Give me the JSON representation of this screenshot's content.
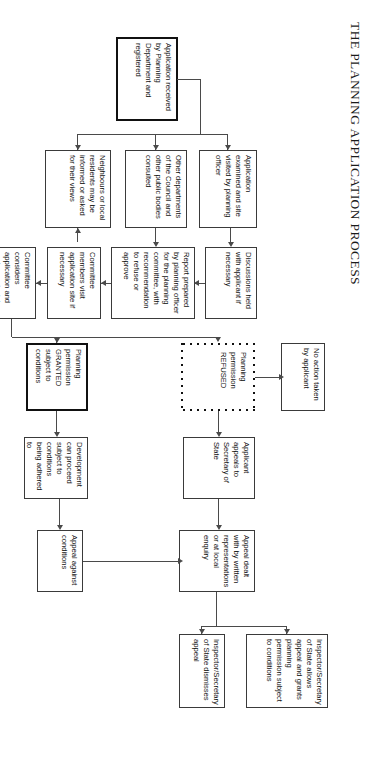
{
  "document": {
    "title": "THE PLANNING APPLICATION PROCESS",
    "orientation": "rotated-90-clockwise",
    "page_background": "#ffffff",
    "line_color": "#4a4a4a",
    "box_border_color": "#3a3a3a"
  },
  "nodes": {
    "application_received": "Application received by Planning Department and registered",
    "application_examined": "Application examined and site visited by planning officer",
    "other_departments": "Other departments of the Council and other public bodies consulted",
    "neighbours": "Neighbours or local residents may be informed or asked for their views",
    "discussions": "Discussions held with applicant if necessary",
    "report_prepared": "Report prepared by planning officer for the planning committee, with recommendation to refuse or approve",
    "committee_visit": "Committee members visit application site if necessary",
    "committee_considers": "Committee considers application and makes a decision",
    "permission_refused": "Planning permission REFUSED",
    "permission_granted": "Planning permission GRANTED subject to conditions",
    "no_action": "No action taken by applicant",
    "applicant_appeals": "Applicant appeals to Secretary of State",
    "development_proceed": "Development can proceed subject to conditions being adhered to",
    "appeal_dealt": "Appeal dealt with by written representations or at local enquiry",
    "appeal_against_conditions": "Appeal against conditions",
    "inspector_allows": "Inspector/Secretary of State allows appeal and grants planning permission subject to conditions",
    "inspector_dismisses": "Inspector/Secretary of State dismisses appeal"
  }
}
